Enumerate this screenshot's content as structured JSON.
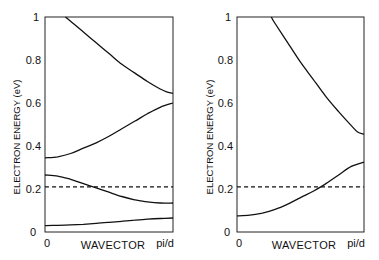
{
  "chart_data": [
    {
      "type": "line",
      "panel": "left",
      "title": "",
      "xlabel": "WAVECTOR",
      "ylabel": "ELECTRON ENERGY (eV)",
      "xticks": [
        "0",
        "pi/d"
      ],
      "yticks": [
        "0",
        "0.2",
        "0.4",
        "0.6",
        "0.8",
        "1"
      ],
      "ylim": [
        0,
        1
      ],
      "xlim": [
        0,
        1
      ],
      "grid": false,
      "legend": null,
      "x": [
        0,
        0.1,
        0.2,
        0.3,
        0.4,
        0.5,
        0.6,
        0.7,
        0.8,
        0.9,
        1.0
      ],
      "series": [
        {
          "name": "band-1",
          "style": "solid",
          "x": [
            0.16,
            0.2,
            0.3,
            0.4,
            0.5,
            0.6,
            0.7,
            0.8,
            0.9,
            0.95,
            1.0
          ],
          "values": [
            1.0,
            0.98,
            0.93,
            0.88,
            0.83,
            0.78,
            0.74,
            0.7,
            0.665,
            0.652,
            0.645
          ]
        },
        {
          "name": "band-2",
          "style": "solid",
          "values": [
            0.345,
            0.35,
            0.365,
            0.39,
            0.415,
            0.445,
            0.48,
            0.515,
            0.55,
            0.58,
            0.6
          ]
        },
        {
          "name": "band-3",
          "style": "solid",
          "values": [
            0.265,
            0.26,
            0.245,
            0.225,
            0.205,
            0.185,
            0.165,
            0.15,
            0.14,
            0.135,
            0.135
          ]
        },
        {
          "name": "band-4",
          "style": "solid",
          "values": [
            0.03,
            0.031,
            0.033,
            0.036,
            0.04,
            0.045,
            0.05,
            0.055,
            0.06,
            0.063,
            0.065
          ]
        },
        {
          "name": "fermi-level",
          "style": "dashed",
          "values": [
            0.21,
            0.21,
            0.21,
            0.21,
            0.21,
            0.21,
            0.21,
            0.21,
            0.21,
            0.21,
            0.21
          ]
        }
      ]
    },
    {
      "type": "line",
      "panel": "right",
      "title": "",
      "xlabel": "WAVECTOR",
      "ylabel": "ELECTRON ENERGY (eV)",
      "xticks": [
        "0",
        "pi/d"
      ],
      "yticks": [
        "0",
        "0.2",
        "0.4",
        "0.6",
        "0.8",
        "1"
      ],
      "ylim": [
        0,
        1
      ],
      "xlim": [
        0,
        1
      ],
      "grid": false,
      "legend": null,
      "x": [
        0,
        0.1,
        0.2,
        0.3,
        0.4,
        0.5,
        0.6,
        0.7,
        0.8,
        0.9,
        1.0
      ],
      "series": [
        {
          "name": "band-1",
          "style": "solid",
          "x": [
            0.27,
            0.3,
            0.4,
            0.5,
            0.6,
            0.7,
            0.8,
            0.9,
            0.95,
            1.0
          ],
          "values": [
            1.0,
            0.97,
            0.88,
            0.79,
            0.71,
            0.63,
            0.56,
            0.495,
            0.465,
            0.455
          ]
        },
        {
          "name": "band-2",
          "style": "solid",
          "values": [
            0.075,
            0.078,
            0.088,
            0.105,
            0.13,
            0.16,
            0.19,
            0.225,
            0.265,
            0.305,
            0.325
          ]
        },
        {
          "name": "fermi-level",
          "style": "dashed",
          "values": [
            0.21,
            0.21,
            0.21,
            0.21,
            0.21,
            0.21,
            0.21,
            0.21,
            0.21,
            0.21,
            0.21
          ]
        }
      ]
    }
  ],
  "labels": {
    "left": {
      "ylabel": "ELECTRON ENERGY (eV)",
      "xlabel": "WAVECTOR",
      "x0": "0",
      "x1": "pi/d",
      "y": [
        "0",
        "0.2",
        "0.4",
        "0.6",
        "0.8",
        "1"
      ]
    },
    "right": {
      "ylabel": "ELECTRON ENERGY (eV)",
      "xlabel": "WAVECTOR",
      "x0": "0",
      "x1": "pi/d",
      "y": [
        "0",
        "0.2",
        "0.4",
        "0.6",
        "0.8",
        "1"
      ]
    }
  }
}
